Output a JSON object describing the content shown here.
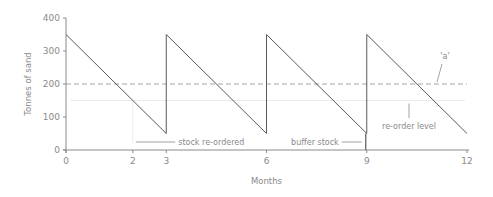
{
  "chart_data": {
    "type": "line",
    "title": "",
    "xlabel": "Months",
    "ylabel": "Tonnes of sand",
    "xlim": [
      0,
      12
    ],
    "ylim": [
      0,
      400
    ],
    "x_ticks": [
      0,
      2,
      3,
      6,
      9,
      12
    ],
    "y_ticks": [
      0,
      100,
      200,
      300,
      400
    ],
    "series": [
      {
        "name": "Stock level",
        "points": [
          [
            0,
            350
          ],
          [
            3,
            50
          ],
          [
            3,
            350
          ],
          [
            6,
            50
          ],
          [
            6,
            350
          ],
          [
            9,
            50
          ],
          [
            9,
            350
          ],
          [
            12,
            50
          ]
        ]
      }
    ],
    "reference_lines": [
      {
        "name": "'a'",
        "y": 200,
        "style": "dashed"
      },
      {
        "name": "re-order level",
        "y": 150,
        "style": "faint"
      }
    ],
    "annotations": [
      {
        "text": "stock re-ordered",
        "x": 2,
        "y": 25
      },
      {
        "text": "buffer stock",
        "x": 9,
        "y": 25
      },
      {
        "text": "re-order level",
        "x": 10.3,
        "y": 150
      },
      {
        "text": "'a'",
        "x": 11.1,
        "y": 200
      }
    ],
    "buffer_stock": 50,
    "grid": false,
    "legend": "none"
  }
}
